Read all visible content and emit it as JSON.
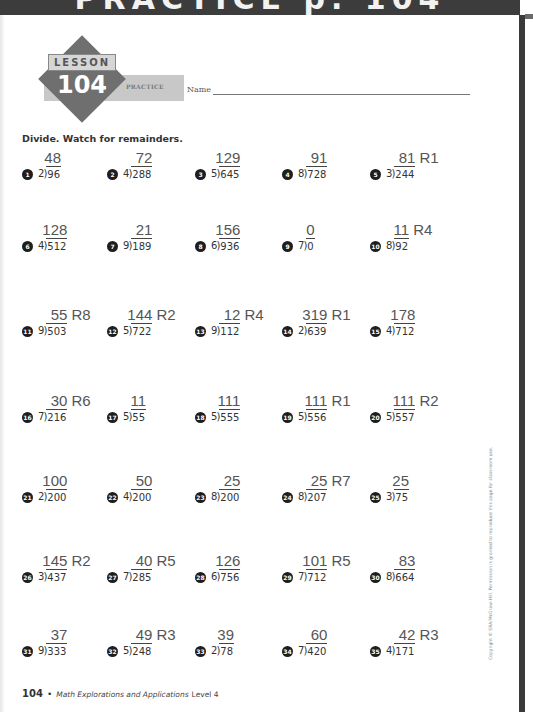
{
  "banner": {
    "title": "PRACTICE p. 104"
  },
  "header": {
    "lesson_label": "LESSON",
    "lesson_number": "104",
    "lesson_type": "PRACTICE",
    "name_label": "Name"
  },
  "instructions": "Divide. Watch for remainders.",
  "problems": [
    {
      "n": "1",
      "divisor": "2",
      "dividend": "96",
      "answer": "48"
    },
    {
      "n": "2",
      "divisor": "4",
      "dividend": "288",
      "answer": "72"
    },
    {
      "n": "3",
      "divisor": "5",
      "dividend": "645",
      "answer": "129"
    },
    {
      "n": "4",
      "divisor": "8",
      "dividend": "728",
      "answer": "91"
    },
    {
      "n": "5",
      "divisor": "3",
      "dividend": "244",
      "answer": "81 R1"
    },
    {
      "n": "6",
      "divisor": "4",
      "dividend": "512",
      "answer": "128"
    },
    {
      "n": "7",
      "divisor": "9",
      "dividend": "189",
      "answer": "21"
    },
    {
      "n": "8",
      "divisor": "6",
      "dividend": "936",
      "answer": "156"
    },
    {
      "n": "9",
      "divisor": "7",
      "dividend": "0",
      "answer": "0"
    },
    {
      "n": "10",
      "divisor": "8",
      "dividend": "92",
      "answer": "11 R4"
    },
    {
      "n": "11",
      "divisor": "9",
      "dividend": "503",
      "answer": "55 R8"
    },
    {
      "n": "12",
      "divisor": "5",
      "dividend": "722",
      "answer": "144 R2"
    },
    {
      "n": "13",
      "divisor": "9",
      "dividend": "112",
      "answer": "12 R4"
    },
    {
      "n": "14",
      "divisor": "2",
      "dividend": "639",
      "answer": "319 R1"
    },
    {
      "n": "15",
      "divisor": "4",
      "dividend": "712",
      "answer": "178"
    },
    {
      "n": "16",
      "divisor": "7",
      "dividend": "216",
      "answer": "30 R6"
    },
    {
      "n": "17",
      "divisor": "5",
      "dividend": "55",
      "answer": "11"
    },
    {
      "n": "18",
      "divisor": "5",
      "dividend": "555",
      "answer": "111"
    },
    {
      "n": "19",
      "divisor": "5",
      "dividend": "556",
      "answer": "111 R1"
    },
    {
      "n": "20",
      "divisor": "5",
      "dividend": "557",
      "answer": "111 R2"
    },
    {
      "n": "21",
      "divisor": "2",
      "dividend": "200",
      "answer": "100"
    },
    {
      "n": "22",
      "divisor": "4",
      "dividend": "200",
      "answer": "50"
    },
    {
      "n": "23",
      "divisor": "8",
      "dividend": "200",
      "answer": "25"
    },
    {
      "n": "24",
      "divisor": "8",
      "dividend": "207",
      "answer": "25 R7"
    },
    {
      "n": "25",
      "divisor": "3",
      "dividend": "75",
      "answer": "25"
    },
    {
      "n": "26",
      "divisor": "3",
      "dividend": "437",
      "answer": "145 R2"
    },
    {
      "n": "27",
      "divisor": "7",
      "dividend": "285",
      "answer": "40 R5"
    },
    {
      "n": "28",
      "divisor": "6",
      "dividend": "756",
      "answer": "126"
    },
    {
      "n": "29",
      "divisor": "7",
      "dividend": "712",
      "answer": "101 R5"
    },
    {
      "n": "30",
      "divisor": "8",
      "dividend": "664",
      "answer": "83"
    },
    {
      "n": "31",
      "divisor": "9",
      "dividend": "333",
      "answer": "37"
    },
    {
      "n": "32",
      "divisor": "5",
      "dividend": "248",
      "answer": "49 R3"
    },
    {
      "n": "33",
      "divisor": "2",
      "dividend": "78",
      "answer": "39"
    },
    {
      "n": "34",
      "divisor": "7",
      "dividend": "420",
      "answer": "60"
    },
    {
      "n": "35",
      "divisor": "4",
      "dividend": "171",
      "answer": "42 R3"
    }
  ],
  "footer": {
    "page_number": "104",
    "separator": "•",
    "book_title": "Math Explorations and Applications",
    "level": "Level 4"
  },
  "copyright": "Copyright © SRA/McGraw-Hill. Permission is granted to reproduce this page for classroom use."
}
